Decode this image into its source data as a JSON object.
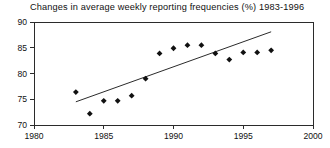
{
  "chart_data": {
    "type": "scatter",
    "title": "Changes in average weekly reporting frequencies (%) 1983-1996",
    "xlabel": "",
    "ylabel": "",
    "xlim": [
      1980,
      2000
    ],
    "ylim": [
      70,
      90
    ],
    "xticks": [
      1980,
      1985,
      1990,
      1995,
      2000
    ],
    "yticks": [
      70,
      75,
      80,
      85,
      90
    ],
    "xtick_labels": [
      "1980",
      "1985",
      "1990",
      "1995",
      "2000"
    ],
    "ytick_labels": [
      "70",
      "75",
      "80",
      "85",
      "90"
    ],
    "grid": false,
    "legend": null,
    "series": [
      {
        "name": "Average weekly reporting frequency",
        "marker": "diamond",
        "color": "#111111",
        "points": [
          {
            "x": 1983,
            "y": 76.4
          },
          {
            "x": 1984,
            "y": 72.2
          },
          {
            "x": 1985,
            "y": 74.7
          },
          {
            "x": 1986,
            "y": 74.7
          },
          {
            "x": 1987,
            "y": 75.7
          },
          {
            "x": 1988,
            "y": 79.0
          },
          {
            "x": 1989,
            "y": 83.9
          },
          {
            "x": 1990,
            "y": 84.9
          },
          {
            "x": 1991,
            "y": 85.5
          },
          {
            "x": 1992,
            "y": 85.5
          },
          {
            "x": 1993,
            "y": 83.9
          },
          {
            "x": 1994,
            "y": 82.7
          },
          {
            "x": 1995,
            "y": 84.1
          },
          {
            "x": 1996,
            "y": 84.1
          },
          {
            "x": 1997,
            "y": 84.5
          }
        ]
      }
    ],
    "trend_line": {
      "name": "linear trend",
      "color": "#2b2b2b",
      "x_start": 1983,
      "y_start": 74.5,
      "x_end": 1997,
      "y_end": 88.1
    }
  },
  "axes": {
    "x_axis_name": "year-axis",
    "y_axis_name": "percentage-axis"
  }
}
